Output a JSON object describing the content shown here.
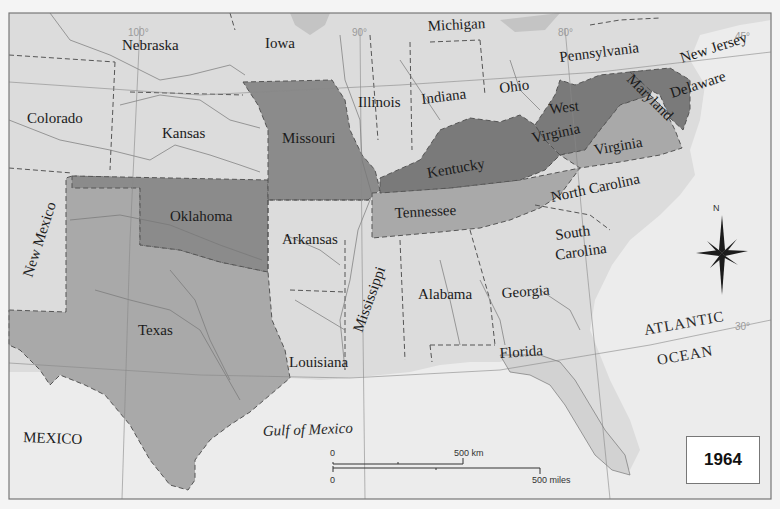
{
  "map": {
    "year": "1964",
    "colors": {
      "ocean": "#ececec",
      "land_light": "#dcdcdc",
      "land_medium": "#a9a9a9",
      "land_dark": "#8b8b8b",
      "land_darkest": "#7a7a7a",
      "border": "#555555"
    },
    "states": {
      "nebraska": "Nebraska",
      "iowa": "Iowa",
      "michigan": "Michigan",
      "pennsylvania": "Pennsylvania",
      "new_jersey": "New Jersey",
      "colorado": "Colorado",
      "kansas": "Kansas",
      "missouri": "Missouri",
      "illinois": "Illinois",
      "indiana": "Indiana",
      "ohio": "Ohio",
      "west": "West",
      "west_virginia": "Virginia",
      "maryland": "Maryland",
      "delaware": "Delaware",
      "kentucky": "Kentucky",
      "virginia": "Virginia",
      "new_mexico": "New Mexico",
      "oklahoma": "Oklahoma",
      "arkansas": "Arkansas",
      "tennessee": "Tennessee",
      "north_carolina": "North Carolina",
      "south": "South",
      "south_carolina": "Carolina",
      "mississippi": "Mississippi",
      "alabama": "Alabama",
      "georgia": "Georgia",
      "texas": "Texas",
      "louisiana": "Louisiana",
      "florida": "Florida"
    },
    "regions": {
      "mexico": "MEXICO",
      "gulf": "Gulf of Mexico",
      "atlantic": "ATLANTIC",
      "ocean": "OCEAN"
    },
    "gridlines": {
      "lon_100": "100°",
      "lon_90": "90°",
      "lon_80": "80°",
      "lat_45": "45°",
      "lat_30": "30°"
    },
    "compass": {
      "north": "N"
    },
    "scale": {
      "km_zero": "0",
      "km_label": "500 km",
      "mi_zero": "0",
      "mi_label": "500 miles"
    }
  }
}
